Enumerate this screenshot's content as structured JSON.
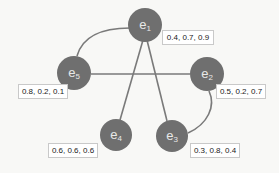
{
  "diagram": {
    "type": "graph",
    "colors": {
      "node": "#6f6f6f",
      "node_text": "#e8e8e8",
      "edge": "#7a7a7a",
      "label_border": "#c9c9c9",
      "background": "#f8f8f6"
    },
    "nodes": [
      {
        "id": "e1",
        "base": "e",
        "sub": "1",
        "values": "0.4, 0.7, 0.9"
      },
      {
        "id": "e2",
        "base": "e",
        "sub": "2",
        "values": "0.5, 0.2, 0.7"
      },
      {
        "id": "e3",
        "base": "e",
        "sub": "3",
        "values": "0.3, 0.8, 0.4"
      },
      {
        "id": "e4",
        "base": "e",
        "sub": "4",
        "values": "0.6, 0.6, 0.6"
      },
      {
        "id": "e5",
        "base": "e",
        "sub": "5",
        "values": "0.8, 0.2, 0.1"
      }
    ],
    "edges": [
      {
        "from": "e1",
        "to": "e5",
        "style": "curved"
      },
      {
        "from": "e1",
        "to": "e4",
        "style": "straight"
      },
      {
        "from": "e1",
        "to": "e3",
        "style": "straight"
      },
      {
        "from": "e5",
        "to": "e2",
        "style": "straight"
      },
      {
        "from": "e2",
        "to": "e3",
        "style": "curved"
      }
    ]
  }
}
